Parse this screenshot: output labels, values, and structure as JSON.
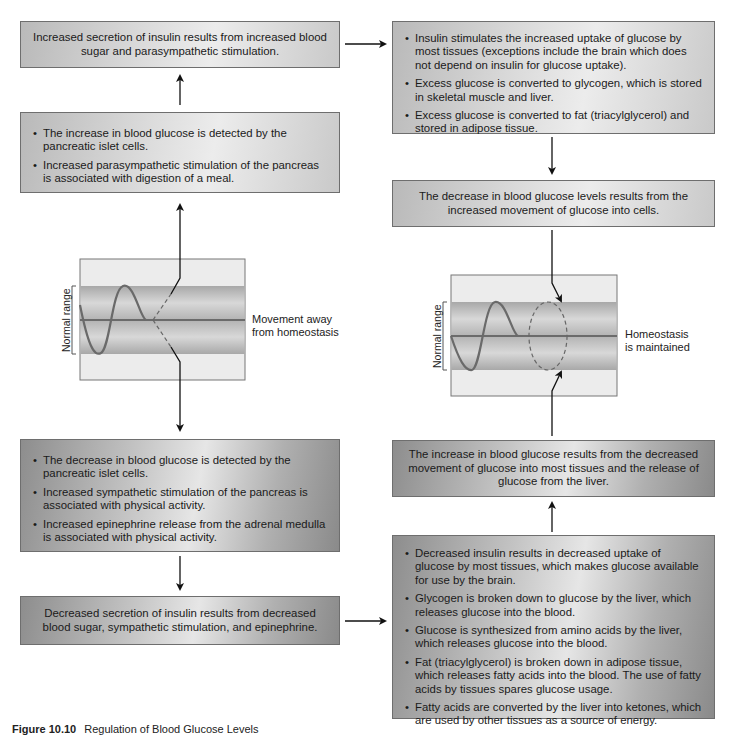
{
  "figure": {
    "caption_number": "Figure 10.10",
    "caption_title": "Regulation of Blood Glucose Levels"
  },
  "boxes": {
    "insulin_secretion_increased": {
      "text": "Increased secretion of insulin results from increased blood sugar and parasympathetic stimulation."
    },
    "increase_detected": {
      "bullets": [
        "The increase in blood glucose is detected by the pancreatic islet cells.",
        "Increased parasympathetic stimulation of the pancreas is associated with digestion of a meal."
      ]
    },
    "insulin_effects": {
      "bullets": [
        "Insulin stimulates the increased uptake of glucose by most tissues (exceptions include the brain which does not depend on insulin for glucose uptake).",
        "Excess glucose is converted to glycogen, which is stored in skeletal muscle and liver.",
        "Excess glucose is converted to fat (triacylglycerol) and stored in adipose tissue."
      ]
    },
    "glucose_decrease_result": {
      "text": "The decrease in blood glucose levels results from the increased movement of glucose into cells."
    },
    "decrease_detected": {
      "bullets": [
        "The decrease in blood glucose is detected by the pancreatic islet cells.",
        "Increased sympathetic stimulation of the pancreas is associated with physical activity.",
        "Increased epinephrine release from the adrenal medulla is associated with physical activity."
      ]
    },
    "insulin_secretion_decreased": {
      "text": "Decreased secretion of insulin results from decreased blood sugar, sympathetic stimulation, and epinephrine."
    },
    "glucose_increase_result": {
      "text": "The increase in blood glucose results from the decreased movement of glucose into most tissues and the release of glucose from the liver."
    },
    "low_insulin_effects": {
      "bullets": [
        "Decreased insulin results in decreased uptake of glucose by most tissues, which makes glucose available for use by the brain.",
        "Glycogen is broken down to glucose by the liver, which releases glucose into the blood.",
        "Glucose is synthesized from amino acids by the liver, which releases glucose into the blood.",
        "Fat (triacylglycerol) is broken down in adipose tissue, which releases fatty acids into the blood. The use of fatty acids by tissues spares glucose usage.",
        "Fatty acids are converted by the liver into ketones, which are used by other tissues as a source of energy."
      ]
    }
  },
  "graphs": {
    "left": {
      "y_label": "Normal range",
      "side_label_line1": "Movement away",
      "side_label_line2": "from homeostasis"
    },
    "right": {
      "y_label": "Normal range",
      "side_label_line1": "Homeostasis",
      "side_label_line2": "is maintained"
    }
  },
  "colors": {
    "box_border": "#6e6e6e",
    "band": "#bdbdbd",
    "graph_bg": "#ececec",
    "curve": "#6a6a6a",
    "arrow": "#111111"
  }
}
